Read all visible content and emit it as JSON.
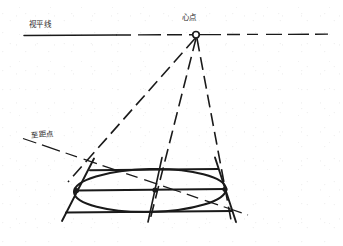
{
  "figure": {
    "title_visible": false,
    "background_color": "#ffffff",
    "ink_color": "#1a1a1a",
    "width": 343,
    "height": 246
  },
  "labels": {
    "horizon_line": "视平线",
    "center_point": "心点",
    "distance_point": "至距点"
  },
  "geometry": {
    "horizon_y": 35,
    "center_point": {
      "x": 196,
      "y": 35,
      "radius": 3.2
    },
    "distance_point_ray": {
      "x1": 24,
      "y1": 139,
      "x2": 243,
      "y2": 213
    },
    "square_near_left": {
      "x": 68,
      "y": 182
    },
    "square_near_right": {
      "x": 228,
      "y": 182
    },
    "square_far_left": {
      "x": 92,
      "y": 160
    },
    "square_far_right": {
      "x": 213,
      "y": 160
    },
    "ellipse_center": {
      "x": 150,
      "y": 180
    },
    "ellipse_rx": 78,
    "ellipse_ry": 23,
    "ellipse_rotation_deg": -2
  },
  "elements": {
    "horizon_line_name": "视平线",
    "vanishing_point_name": "心点",
    "distance_point_name": "至距点",
    "orthogonal_rays_count": 3,
    "transversal_lines_count": 3
  }
}
